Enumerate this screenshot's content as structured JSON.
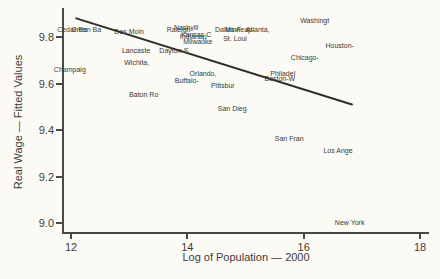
{
  "figure": {
    "background_color": "#fbfaf4",
    "text_color": "#3f3d38",
    "axis_color": "#4a4843",
    "fit_line_color": "#2f2d2a"
  },
  "chart_data": {
    "type": "scatter",
    "title": "",
    "xlabel": "Log of Population — 2000",
    "ylabel": "Real Wage — Fitted Values",
    "xlim": [
      12,
      18
    ],
    "ylim": [
      8.95,
      9.9
    ],
    "x_ticks": [
      12,
      14,
      16,
      18
    ],
    "x_tick_labels": [
      "12",
      "14",
      "16",
      "18"
    ],
    "y_ticks": [
      9.0,
      9.2,
      9.4,
      9.6,
      9.8
    ],
    "y_tick_labels": [
      "9.0",
      "9.2",
      "9.4",
      "9.6",
      "9.8"
    ],
    "grid": false,
    "legend": "none",
    "marker_style": "city-name-labels",
    "points": [
      {
        "label": "Cedar Ra",
        "x": 12.02,
        "y": 9.83
      },
      {
        "label": "Green Ba",
        "x": 12.26,
        "y": 9.83
      },
      {
        "label": "Champaig",
        "x": 11.98,
        "y": 9.66
      },
      {
        "label": "Des Moin",
        "x": 13.0,
        "y": 9.82
      },
      {
        "label": "Lancaste",
        "x": 13.12,
        "y": 9.74
      },
      {
        "label": "Wichita,",
        "x": 13.13,
        "y": 9.69
      },
      {
        "label": "Dayton-S",
        "x": 13.77,
        "y": 9.74
      },
      {
        "label": "Baton Ro",
        "x": 13.25,
        "y": 9.55
      },
      {
        "label": "Nashvill",
        "x": 13.98,
        "y": 9.84
      },
      {
        "label": "Raleigh-",
        "x": 13.87,
        "y": 9.83
      },
      {
        "label": "Kansas C",
        "x": 14.15,
        "y": 9.81
      },
      {
        "label": "Indianap",
        "x": 14.1,
        "y": 9.8
      },
      {
        "label": "Milwauke",
        "x": 14.18,
        "y": 9.78
      },
      {
        "label": "St. Loui",
        "x": 14.82,
        "y": 9.79
      },
      {
        "label": "Dallas-F",
        "x": 14.7,
        "y": 9.83
      },
      {
        "label": "Minneap-",
        "x": 14.9,
        "y": 9.83
      },
      {
        "label": "Atlanta,",
        "x": 15.21,
        "y": 9.83
      },
      {
        "label": "Orlando,",
        "x": 14.27,
        "y": 9.64
      },
      {
        "label": "Buffalo-",
        "x": 13.99,
        "y": 9.61
      },
      {
        "label": "Pittsbur",
        "x": 14.61,
        "y": 9.59
      },
      {
        "label": "San Dieg",
        "x": 14.77,
        "y": 9.49
      },
      {
        "label": "Washingt",
        "x": 16.19,
        "y": 9.87
      },
      {
        "label": "Houston-",
        "x": 16.62,
        "y": 9.76
      },
      {
        "label": "Chicago-",
        "x": 16.02,
        "y": 9.71
      },
      {
        "label": "Philadel",
        "x": 15.64,
        "y": 9.64
      },
      {
        "label": "Boston-W",
        "x": 15.59,
        "y": 9.62
      },
      {
        "label": "San Fran",
        "x": 15.75,
        "y": 9.36
      },
      {
        "label": "Los Ange",
        "x": 16.59,
        "y": 9.31
      },
      {
        "label": "New York",
        "x": 16.79,
        "y": 9.0
      }
    ],
    "fit_line": {
      "x1": 12.09,
      "y1": 9.88,
      "x2": 16.83,
      "y2": 9.51
    }
  }
}
